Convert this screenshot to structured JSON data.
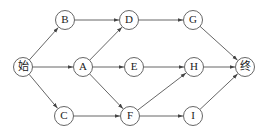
{
  "diagram": {
    "type": "directed-network",
    "colors": {
      "stroke": "#555555",
      "text": "#222222",
      "background": "#ffffff"
    },
    "nodes": [
      {
        "id": "start",
        "label": "始",
        "x": 23,
        "y": 67
      },
      {
        "id": "B",
        "label": "B",
        "x": 65,
        "y": 20
      },
      {
        "id": "A",
        "label": "A",
        "x": 83,
        "y": 67
      },
      {
        "id": "C",
        "label": "C",
        "x": 64,
        "y": 116
      },
      {
        "id": "D",
        "label": "D",
        "x": 129,
        "y": 20
      },
      {
        "id": "E",
        "label": "E",
        "x": 134,
        "y": 67
      },
      {
        "id": "F",
        "label": "F",
        "x": 130,
        "y": 116
      },
      {
        "id": "G",
        "label": "G",
        "x": 193,
        "y": 20
      },
      {
        "id": "H",
        "label": "H",
        "x": 194,
        "y": 67
      },
      {
        "id": "I",
        "label": "I",
        "x": 193,
        "y": 116
      },
      {
        "id": "end",
        "label": "终",
        "x": 245,
        "y": 67
      }
    ],
    "edges": [
      {
        "from": "start",
        "to": "B"
      },
      {
        "from": "start",
        "to": "A"
      },
      {
        "from": "start",
        "to": "C"
      },
      {
        "from": "B",
        "to": "D"
      },
      {
        "from": "A",
        "to": "D"
      },
      {
        "from": "A",
        "to": "E"
      },
      {
        "from": "A",
        "to": "F"
      },
      {
        "from": "C",
        "to": "F"
      },
      {
        "from": "D",
        "to": "G"
      },
      {
        "from": "E",
        "to": "H"
      },
      {
        "from": "F",
        "to": "H"
      },
      {
        "from": "F",
        "to": "I"
      },
      {
        "from": "G",
        "to": "end"
      },
      {
        "from": "H",
        "to": "end"
      },
      {
        "from": "I",
        "to": "end"
      }
    ],
    "node_radius": 9.5
  }
}
